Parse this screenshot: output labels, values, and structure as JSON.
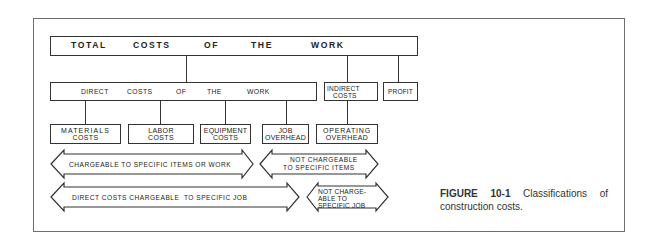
{
  "diagram": {
    "level1": {
      "total_words": [
        "TOTAL",
        "COSTS",
        "OF",
        "THE",
        "WORK"
      ]
    },
    "level2": {
      "direct_words": [
        "DIRECT",
        "COSTS",
        "OF",
        "THE",
        "WORK"
      ],
      "indirect_line1": "INDIRECT",
      "indirect_line2": "COSTS",
      "profit": "PROFIT"
    },
    "level3": {
      "materials_line1": "MATERIALS",
      "materials_line2": "COSTS",
      "labor_line1": "LABOR",
      "labor_line2": "COSTS",
      "equipment_line1": "EQUIPMENT",
      "equipment_line2": "COSTS",
      "job_overhead_line1": "JOB",
      "job_overhead_line2": "OVERHEAD",
      "operating_overhead_line1": "OPERATING",
      "operating_overhead_line2": "OVERHEAD"
    },
    "arrows": {
      "chargeable_items": "CHARGEABLE TO SPECIFIC ITEMS OR WORK",
      "not_chargeable_items_line1": "NOT CHARGEABLE",
      "not_chargeable_items_line2": "TO SPECIFIC ITEMS",
      "direct_chargeable_job": "DIRECT COSTS CHARGEABLE  TO SPECIFIC JOB",
      "not_chargeable_job_line1": "NOT CHARGE-",
      "not_chargeable_job_line2": "ABLE TO",
      "not_chargeable_job_line3": "SPECIFIC JOB"
    }
  },
  "caption": {
    "label": "FIGURE 10-1",
    "text": "Classifications of construction costs."
  },
  "colors": {
    "line": "#333333",
    "frame": "#6e6e6e",
    "background": "#ffffff"
  }
}
